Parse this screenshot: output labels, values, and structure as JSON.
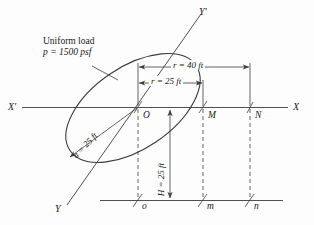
{
  "figure": {
    "title_note": {
      "line1": "Uniform load",
      "line2": "p = 1500 psf"
    },
    "axes": {
      "x_left_label": "X'",
      "x_right_label": "X",
      "y_top_label": "Y'",
      "y_bottom_label": "Y"
    },
    "points": {
      "origin": "O",
      "mid_upper": "M",
      "far_upper": "N",
      "origin_lower": "o",
      "mid_lower": "m",
      "far_lower": "n"
    },
    "dimensions": {
      "r_outer": "r = 40 ft",
      "r_inner": "r = 25 ft",
      "semi_axis": "a = 25 ft",
      "depth": "H = 25 ft"
    },
    "colors": {
      "line": "#3c3c3c",
      "text": "#1a1a1a",
      "background": "#fdfdfd"
    }
  }
}
